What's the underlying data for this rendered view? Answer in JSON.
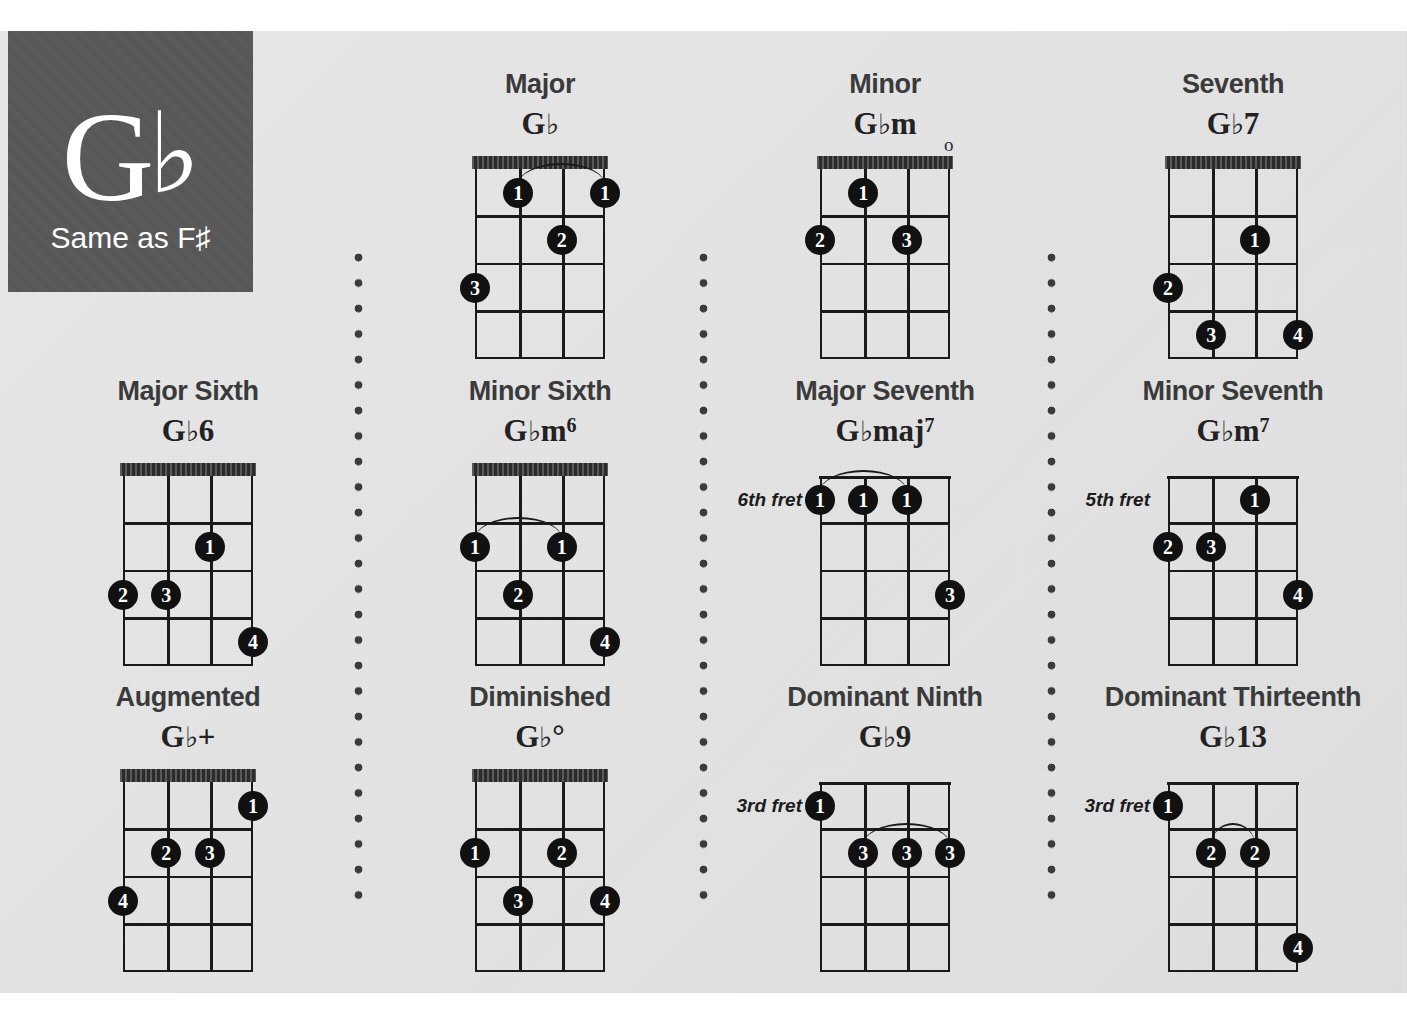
{
  "key_badge": {
    "root": "G",
    "accidental": "♭",
    "subtitle": "Same as F♯"
  },
  "colors": {
    "page_background": "#e6e6e6",
    "badge_background": "#575757",
    "ink": "#1a1a1a",
    "heading": "#3a3a3a",
    "dot_fill": "#111111",
    "dot_text": "#ffffff"
  },
  "instrument": {
    "strings": 4,
    "frets": 4
  },
  "chord_data": {
    "type": "chord-chart",
    "title": "G♭ Chord Chart",
    "chords": [
      {
        "title": "Major",
        "name_root": "G",
        "name_flat": "♭",
        "name_suffix": "",
        "name_sup": "",
        "fret_label": "",
        "open_strings": [],
        "fingers": [
          {
            "label": "1",
            "string": 2,
            "fret": 1
          },
          {
            "label": "1",
            "string": 4,
            "fret": 1
          },
          {
            "label": "2",
            "string": 3,
            "fret": 2
          },
          {
            "label": "3",
            "string": 1,
            "fret": 3
          }
        ],
        "barres": [
          {
            "fret": 1,
            "from_string": 2,
            "to_string": 4
          }
        ]
      },
      {
        "title": "Minor",
        "name_root": "G",
        "name_flat": "♭",
        "name_suffix": "m",
        "name_sup": "",
        "fret_label": "",
        "open_strings": [
          4
        ],
        "fingers": [
          {
            "label": "1",
            "string": 2,
            "fret": 1
          },
          {
            "label": "2",
            "string": 1,
            "fret": 2
          },
          {
            "label": "3",
            "string": 3,
            "fret": 2
          }
        ],
        "barres": []
      },
      {
        "title": "Seventh",
        "name_root": "G",
        "name_flat": "♭",
        "name_suffix": "7",
        "name_sup": "",
        "fret_label": "",
        "open_strings": [],
        "fingers": [
          {
            "label": "1",
            "string": 3,
            "fret": 2
          },
          {
            "label": "2",
            "string": 1,
            "fret": 3
          },
          {
            "label": "3",
            "string": 2,
            "fret": 4
          },
          {
            "label": "4",
            "string": 4,
            "fret": 4
          }
        ],
        "barres": []
      },
      {
        "title": "Major Sixth",
        "name_root": "G",
        "name_flat": "♭",
        "name_suffix": "6",
        "name_sup": "",
        "fret_label": "",
        "open_strings": [],
        "fingers": [
          {
            "label": "1",
            "string": 3,
            "fret": 2
          },
          {
            "label": "2",
            "string": 1,
            "fret": 3
          },
          {
            "label": "3",
            "string": 2,
            "fret": 3
          },
          {
            "label": "4",
            "string": 4,
            "fret": 4
          }
        ],
        "barres": []
      },
      {
        "title": "Minor Sixth",
        "name_root": "G",
        "name_flat": "♭",
        "name_suffix": "m",
        "name_sup": "6",
        "fret_label": "",
        "open_strings": [],
        "fingers": [
          {
            "label": "1",
            "string": 1,
            "fret": 2
          },
          {
            "label": "1",
            "string": 3,
            "fret": 2
          },
          {
            "label": "2",
            "string": 2,
            "fret": 3
          },
          {
            "label": "4",
            "string": 4,
            "fret": 4
          }
        ],
        "barres": [
          {
            "fret": 2,
            "from_string": 1,
            "to_string": 3
          }
        ]
      },
      {
        "title": "Major Seventh",
        "name_root": "G",
        "name_flat": "♭",
        "name_suffix": "maj",
        "name_sup": "7",
        "fret_label": "6th fret",
        "open_strings": [],
        "fingers": [
          {
            "label": "1",
            "string": 1,
            "fret": 1
          },
          {
            "label": "1",
            "string": 2,
            "fret": 1
          },
          {
            "label": "1",
            "string": 3,
            "fret": 1
          },
          {
            "label": "3",
            "string": 4,
            "fret": 3
          }
        ],
        "barres": [
          {
            "fret": 1,
            "from_string": 1,
            "to_string": 3
          }
        ]
      },
      {
        "title": "Minor Seventh",
        "name_root": "G",
        "name_flat": "♭",
        "name_suffix": "m",
        "name_sup": "7",
        "fret_label": "5th fret",
        "open_strings": [],
        "fingers": [
          {
            "label": "1",
            "string": 3,
            "fret": 1
          },
          {
            "label": "2",
            "string": 1,
            "fret": 2
          },
          {
            "label": "3",
            "string": 2,
            "fret": 2
          },
          {
            "label": "4",
            "string": 4,
            "fret": 3
          }
        ],
        "barres": []
      },
      {
        "title": "Augmented",
        "name_root": "G",
        "name_flat": "♭",
        "name_suffix": "+",
        "name_sup": "",
        "fret_label": "",
        "open_strings": [],
        "fingers": [
          {
            "label": "1",
            "string": 4,
            "fret": 1
          },
          {
            "label": "2",
            "string": 2,
            "fret": 2
          },
          {
            "label": "3",
            "string": 3,
            "fret": 2
          },
          {
            "label": "4",
            "string": 1,
            "fret": 3
          }
        ],
        "barres": []
      },
      {
        "title": "Diminished",
        "name_root": "G",
        "name_flat": "♭",
        "name_suffix": "°",
        "name_sup": "",
        "fret_label": "",
        "open_strings": [],
        "fingers": [
          {
            "label": "1",
            "string": 1,
            "fret": 2
          },
          {
            "label": "2",
            "string": 3,
            "fret": 2
          },
          {
            "label": "3",
            "string": 2,
            "fret": 3
          },
          {
            "label": "4",
            "string": 4,
            "fret": 3
          }
        ],
        "barres": []
      },
      {
        "title": "Dominant Ninth",
        "name_root": "G",
        "name_flat": "♭",
        "name_suffix": "9",
        "name_sup": "",
        "fret_label": "3rd fret",
        "open_strings": [],
        "fingers": [
          {
            "label": "1",
            "string": 1,
            "fret": 1
          },
          {
            "label": "3",
            "string": 2,
            "fret": 2
          },
          {
            "label": "3",
            "string": 3,
            "fret": 2
          },
          {
            "label": "3",
            "string": 4,
            "fret": 2
          }
        ],
        "barres": [
          {
            "fret": 2,
            "from_string": 2,
            "to_string": 4
          }
        ]
      },
      {
        "title": "Dominant Thirteenth",
        "name_root": "G",
        "name_flat": "♭",
        "name_suffix": "13",
        "name_sup": "",
        "fret_label": "3rd fret",
        "open_strings": [],
        "fingers": [
          {
            "label": "1",
            "string": 1,
            "fret": 1
          },
          {
            "label": "2",
            "string": 2,
            "fret": 2
          },
          {
            "label": "2",
            "string": 3,
            "fret": 2
          },
          {
            "label": "4",
            "string": 4,
            "fret": 4
          }
        ],
        "barres": [
          {
            "fret": 2,
            "from_string": 2,
            "to_string": 3
          }
        ]
      }
    ]
  }
}
